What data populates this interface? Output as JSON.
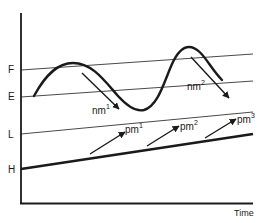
{
  "diagram": {
    "axes": {
      "x_label": "Time",
      "y_levels": [
        {
          "key": "F",
          "label": "F"
        },
        {
          "key": "E",
          "label": "E"
        },
        {
          "key": "L",
          "label": "L"
        },
        {
          "key": "H",
          "label": "H"
        }
      ]
    },
    "lines": [
      {
        "key": "F",
        "style": "thin",
        "trend": "rising"
      },
      {
        "key": "E",
        "style": "thin",
        "trend": "rising"
      },
      {
        "key": "L",
        "style": "thin",
        "trend": "rising"
      },
      {
        "key": "H",
        "style": "thick",
        "trend": "rising"
      }
    ],
    "curve": {
      "description": "oscillating wave between E and F levels",
      "peaks": 2,
      "troughs": 1
    },
    "arrows": [
      {
        "key": "nm1",
        "base": "nm",
        "sup": "1",
        "direction": "down-right"
      },
      {
        "key": "nm2",
        "base": "nm",
        "sup": "2",
        "direction": "down-right"
      },
      {
        "key": "pm1",
        "base": "pm",
        "sup": "1",
        "direction": "up-right"
      },
      {
        "key": "pm2",
        "base": "pm",
        "sup": "2",
        "direction": "up-right"
      },
      {
        "key": "pm3",
        "base": "pm",
        "sup": "3",
        "direction": "up-right"
      }
    ],
    "colors": {
      "ink": "#1a1a1a",
      "background": "#ffffff"
    }
  }
}
